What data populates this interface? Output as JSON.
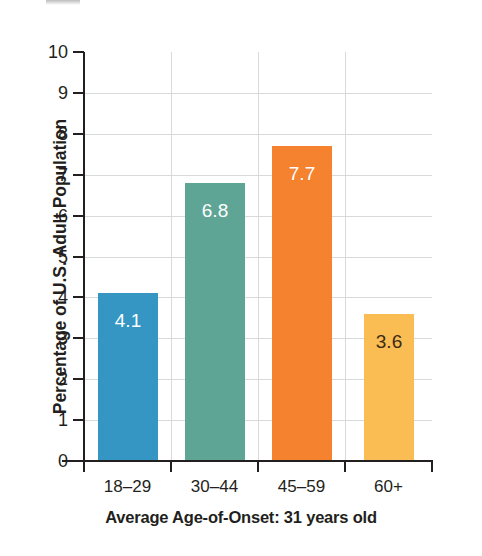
{
  "chart_data": {
    "type": "bar",
    "title": "",
    "xlabel": "",
    "ylabel": "Percentage of U.S. Adult Population",
    "categories": [
      "18–29",
      "30–44",
      "45–59",
      "60+"
    ],
    "values": [
      4.1,
      6.8,
      7.7,
      3.6
    ],
    "value_labels": [
      "4.1",
      "6.8",
      "7.7",
      "3.6"
    ],
    "bar_colors": [
      "#3596c4",
      "#5ea595",
      "#f4822f",
      "#f9bd53"
    ],
    "value_label_colors": [
      "#ffffff",
      "#ffffff",
      "#ffffff",
      "#3d2b14"
    ],
    "ylim": [
      0,
      10
    ],
    "ytick_labels": [
      "0",
      "1",
      "2",
      "3",
      "4",
      "5",
      "6",
      "7",
      "8",
      "9",
      "10"
    ],
    "ytick_values": [
      0,
      1,
      2,
      3,
      4,
      5,
      6,
      7,
      8,
      9,
      10
    ],
    "grid": "horizontal-and-vertical",
    "grid_color": "#d7d9da",
    "legend": "none",
    "caption": "Average Age-of-Onset: 31 years old",
    "axis_color": "#231f20",
    "background": "#ffffff"
  },
  "figure": {
    "caption": "Average Age-of-Onset: 31 years old",
    "ylabel": "Percentage of U.S. Adult Population"
  }
}
